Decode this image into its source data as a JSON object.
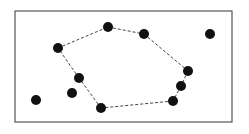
{
  "diagram": {
    "type": "convex-hull",
    "frame": {
      "x": 15,
      "y": 11,
      "width": 217,
      "height": 111,
      "stroke": "#555555"
    },
    "point_color": "#111111",
    "point_radius": 5,
    "hull_color": "#444444",
    "points": [
      {
        "id": "p1",
        "x": 58,
        "y": 48,
        "on_hull": true
      },
      {
        "id": "p2",
        "x": 108,
        "y": 27,
        "on_hull": true
      },
      {
        "id": "p3",
        "x": 144,
        "y": 34,
        "on_hull": true
      },
      {
        "id": "p4",
        "x": 188,
        "y": 71,
        "on_hull": true
      },
      {
        "id": "p5",
        "x": 181,
        "y": 86,
        "on_hull": true
      },
      {
        "id": "p6",
        "x": 173,
        "y": 101,
        "on_hull": true
      },
      {
        "id": "p7",
        "x": 101,
        "y": 108,
        "on_hull": true
      },
      {
        "id": "p8",
        "x": 79,
        "y": 78,
        "on_hull": true
      },
      {
        "id": "p9",
        "x": 210,
        "y": 34,
        "on_hull": false
      },
      {
        "id": "p10",
        "x": 72,
        "y": 93,
        "on_hull": false
      },
      {
        "id": "p11",
        "x": 36,
        "y": 100,
        "on_hull": false
      }
    ],
    "hull_order": [
      "p1",
      "p2",
      "p3",
      "p4",
      "p5",
      "p6",
      "p7",
      "p8"
    ]
  }
}
